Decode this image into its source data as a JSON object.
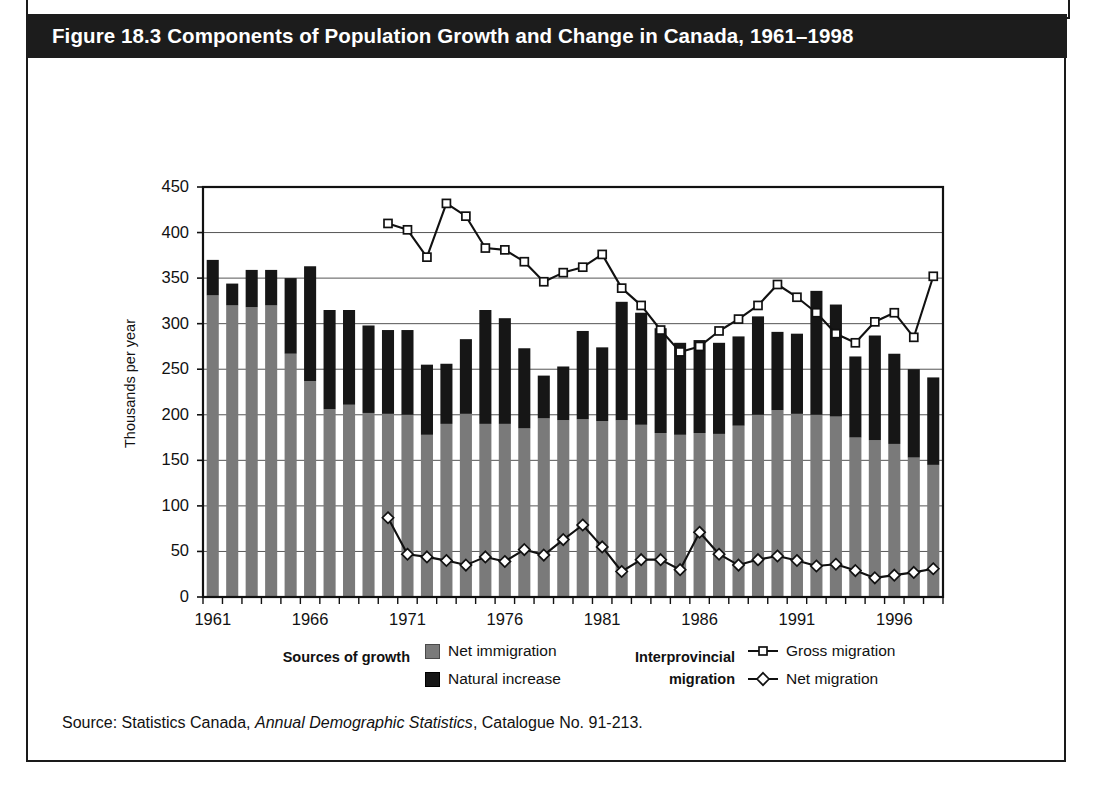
{
  "figure": {
    "title": "Figure 18.3 Components of Population Growth and Change in Canada, 1961–1998",
    "source_prefix": "Source: Statistics Canada, ",
    "source_italic": "Annual Demographic Statistics",
    "source_suffix": ", Catalogue No. 91-213."
  },
  "legend": {
    "group1_title_line1": "Sources of growth",
    "group1_title_line2": "",
    "group2_title_line1": "Interprovincial",
    "group2_title_line2": "migration",
    "entries": [
      {
        "label": "Net immigration",
        "kind": "swatch-grey"
      },
      {
        "label": "Natural increase",
        "kind": "swatch-black"
      },
      {
        "label": "Gross migration",
        "kind": "line-square"
      },
      {
        "label": "Net migration",
        "kind": "line-diamond"
      }
    ]
  },
  "colors": {
    "net_immigration": "#7a7a7a",
    "natural_increase": "#161616",
    "line": "#111111",
    "marker_fill": "#ffffff",
    "axis": "#111111",
    "grid": "#555555",
    "title_bar": "#1c1c1c",
    "title_text": "#ffffff",
    "page_bg": "#ffffff"
  },
  "chart_data": {
    "type": "bar",
    "title": "Figure 18.3 Components of Population Growth and Change in Canada, 1961–1998",
    "subtitle": "",
    "xlabel": "",
    "ylabel": "Thousands per year",
    "ylim": [
      0,
      450
    ],
    "ytick_step": 50,
    "yticks": [
      0,
      50,
      100,
      150,
      200,
      250,
      300,
      350,
      400,
      450
    ],
    "grid": true,
    "legend_position": "below",
    "stacked": true,
    "x": [
      1961,
      1962,
      1963,
      1964,
      1965,
      1966,
      1967,
      1968,
      1969,
      1970,
      1971,
      1972,
      1973,
      1974,
      1975,
      1976,
      1977,
      1978,
      1979,
      1980,
      1981,
      1982,
      1983,
      1984,
      1985,
      1986,
      1987,
      1988,
      1989,
      1990,
      1991,
      1992,
      1993,
      1994,
      1995,
      1996,
      1997,
      1998
    ],
    "xtick_labels": [
      "1961",
      "1966",
      "1971",
      "1976",
      "1981",
      "1986",
      "1991",
      "1996"
    ],
    "xtick_values": [
      1961,
      1966,
      1971,
      1976,
      1981,
      1986,
      1991,
      1996
    ],
    "series": [
      {
        "name": "Net immigration",
        "type": "bar-segment",
        "color": "#7a7a7a",
        "values": [
          331,
          320,
          318,
          320,
          267,
          237,
          206,
          211,
          202,
          201,
          200,
          178,
          190,
          201,
          190,
          190,
          185,
          196,
          194,
          195,
          193,
          194,
          189,
          180,
          178,
          180,
          179,
          188,
          200,
          205,
          201,
          200,
          198,
          175,
          172,
          168,
          153,
          145
        ]
      },
      {
        "name": "Natural increase",
        "type": "bar-segment",
        "color": "#161616",
        "values": [
          39,
          24,
          41,
          39,
          83,
          126,
          109,
          104,
          96,
          92,
          93,
          77,
          66,
          82,
          125,
          116,
          88,
          47,
          59,
          97,
          81,
          130,
          123,
          115,
          101,
          102,
          100,
          98,
          108,
          86,
          88,
          136,
          123,
          89,
          115,
          99,
          97,
          96
        ]
      },
      {
        "name": "Total (stack top)",
        "type": "bar-total",
        "values": [
          370,
          344,
          359,
          359,
          350,
          363,
          315,
          315,
          298,
          293,
          293,
          255,
          256,
          283,
          315,
          306,
          273,
          243,
          253,
          292,
          274,
          324,
          312,
          295,
          279,
          282,
          279,
          286,
          308,
          291,
          289,
          336,
          321,
          264,
          287,
          267,
          250,
          241
        ]
      },
      {
        "name": "Gross migration",
        "type": "line",
        "marker": "square",
        "x": [
          1970,
          1971,
          1972,
          1973,
          1974,
          1975,
          1976,
          1977,
          1978,
          1979,
          1980,
          1981,
          1982,
          1983,
          1984,
          1985,
          1986,
          1987,
          1988,
          1989,
          1990,
          1991,
          1992,
          1993,
          1994,
          1995,
          1996,
          1997,
          1998
        ],
        "values": [
          410,
          403,
          373,
          432,
          418,
          383,
          381,
          368,
          346,
          356,
          362,
          376,
          339,
          320,
          293,
          269,
          275,
          292,
          305,
          320,
          343,
          329,
          312,
          289,
          279,
          302,
          312,
          285,
          352
        ]
      },
      {
        "name": "Net migration",
        "type": "line",
        "marker": "diamond",
        "x": [
          1970,
          1971,
          1972,
          1973,
          1974,
          1975,
          1976,
          1977,
          1978,
          1979,
          1980,
          1981,
          1982,
          1983,
          1984,
          1985,
          1986,
          1987,
          1988,
          1989,
          1990,
          1991,
          1992,
          1993,
          1994,
          1995,
          1996,
          1997,
          1998
        ],
        "values": [
          87,
          47,
          44,
          40,
          35,
          44,
          39,
          52,
          46,
          63,
          79,
          55,
          28,
          41,
          41,
          30,
          71,
          47,
          35,
          41,
          45,
          40,
          34,
          36,
          29,
          21,
          24,
          27,
          31
        ]
      }
    ],
    "annotations": []
  }
}
